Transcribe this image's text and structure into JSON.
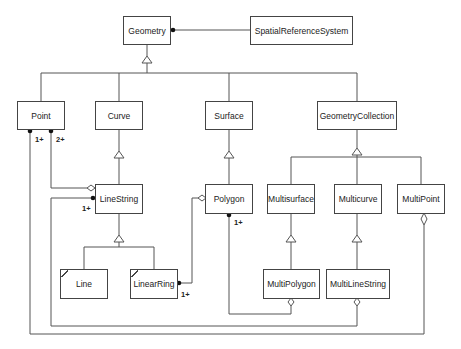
{
  "diagram": {
    "type": "UML class diagram",
    "classes": [
      {
        "id": "geometry",
        "label": "Geometry"
      },
      {
        "id": "srs",
        "label": "SpatialReferenceSystem"
      },
      {
        "id": "point",
        "label": "Point"
      },
      {
        "id": "curve",
        "label": "Curve"
      },
      {
        "id": "surface",
        "label": "Surface"
      },
      {
        "id": "geometrycollection",
        "label": "GeometryCollection"
      },
      {
        "id": "linestring",
        "label": "LineString"
      },
      {
        "id": "polygon",
        "label": "Polygon"
      },
      {
        "id": "multisurface",
        "label": "Multisurface"
      },
      {
        "id": "multicurve",
        "label": "Multicurve"
      },
      {
        "id": "multipoint",
        "label": "MultiPoint"
      },
      {
        "id": "line",
        "label": "Line"
      },
      {
        "id": "linearring",
        "label": "LinearRing"
      },
      {
        "id": "multipolygon",
        "label": "MultiPolygon"
      },
      {
        "id": "multilinestring",
        "label": "MultiLineString"
      }
    ],
    "multiplicities": {
      "point_to_multipoint": "1+",
      "point_to_linestring": "2+",
      "linestring_to_multilinestring": "1+",
      "polygon_to_multipolygon": "1+",
      "linearring_to_polygon": "1+"
    },
    "relationships": [
      {
        "from": "geometry",
        "to": "srs",
        "kind": "association"
      },
      {
        "from": "point",
        "to": "geometry",
        "kind": "generalization"
      },
      {
        "from": "curve",
        "to": "geometry",
        "kind": "generalization"
      },
      {
        "from": "surface",
        "to": "geometry",
        "kind": "generalization"
      },
      {
        "from": "geometrycollection",
        "to": "geometry",
        "kind": "generalization"
      },
      {
        "from": "linestring",
        "to": "curve",
        "kind": "generalization"
      },
      {
        "from": "polygon",
        "to": "surface",
        "kind": "generalization"
      },
      {
        "from": "multisurface",
        "to": "geometrycollection",
        "kind": "generalization"
      },
      {
        "from": "multicurve",
        "to": "geometrycollection",
        "kind": "generalization"
      },
      {
        "from": "multipoint",
        "to": "geometrycollection",
        "kind": "generalization"
      },
      {
        "from": "line",
        "to": "linestring",
        "kind": "generalization"
      },
      {
        "from": "linearring",
        "to": "linestring",
        "kind": "generalization"
      },
      {
        "from": "multipolygon",
        "to": "multisurface",
        "kind": "generalization"
      },
      {
        "from": "multilinestring",
        "to": "multicurve",
        "kind": "generalization"
      },
      {
        "from": "point",
        "to": "linestring",
        "kind": "aggregation",
        "multiplicity": "2+"
      },
      {
        "from": "point",
        "to": "multipoint",
        "kind": "aggregation",
        "multiplicity": "1+"
      },
      {
        "from": "linestring",
        "to": "multilinestring",
        "kind": "aggregation",
        "multiplicity": "1+"
      },
      {
        "from": "linearring",
        "to": "polygon",
        "kind": "aggregation",
        "multiplicity": "1+"
      },
      {
        "from": "polygon",
        "to": "multipolygon",
        "kind": "aggregation",
        "multiplicity": "1+"
      }
    ]
  }
}
